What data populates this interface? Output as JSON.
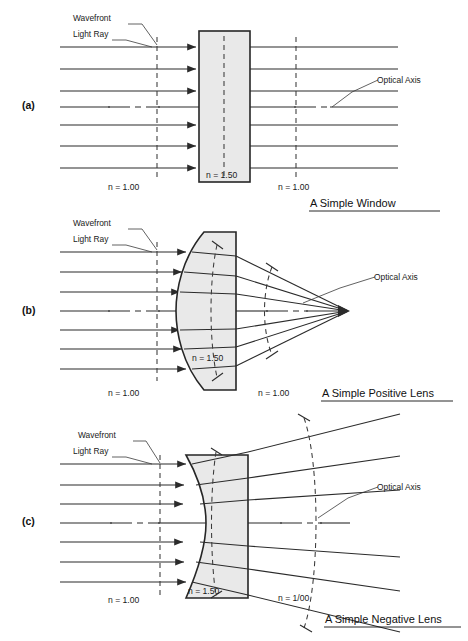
{
  "figure": {
    "background": "#ffffff",
    "ink": "#1a1a1a",
    "glass_fill": "#e9e9e9"
  },
  "common_labels": {
    "wavefront": "Wavefront",
    "light_ray": "Light Ray",
    "optical_axis": "Optical Axis",
    "n_air": "n = 1.00",
    "n_glass": "n = 1.50"
  },
  "panels": [
    {
      "id": "a",
      "letter": "(a)",
      "caption": "A Simple Window",
      "element": "plane-parallel window",
      "labels": {
        "wavefront": "Wavefront",
        "light_ray": "Light Ray",
        "optical_axis": "Optical Axis",
        "n_left": "n = 1.00",
        "n_glass": "n = 1.50",
        "n_right": "n = 1.00"
      },
      "ray_count": 7,
      "wavefronts": "straight vertical dashed lines before and after the window (undeviated)",
      "rays_exit": "parallel, undeviated"
    },
    {
      "id": "b",
      "letter": "(b)",
      "caption": "A Simple Positive Lens",
      "element": "plano-convex positive lens, convex side facing incoming light",
      "labels": {
        "wavefront": "Wavefront",
        "light_ray": "Light Ray",
        "optical_axis": "Optical Axis",
        "n_left": "n = 1.00",
        "n_glass": "n = 1.50",
        "n_right": "n = 1.00"
      },
      "ray_count": 7,
      "wavefronts": "flat entering, curved converging after the lens",
      "rays_exit": "converge to a single focal point on the optical axis"
    },
    {
      "id": "c",
      "letter": "(c)",
      "caption": "A Simple Negative Lens",
      "element": "plano-concave negative lens, concave side facing incoming light",
      "labels": {
        "wavefront": "Wavefront",
        "light_ray": "Light Ray",
        "optical_axis": "Optical Axis",
        "n_left": "n = 1.00",
        "n_glass": "n = 1.50",
        "n_right": "n = 1/00"
      },
      "ray_count": 7,
      "wavefronts": "flat entering, curved diverging after the lens",
      "rays_exit": "diverge away from the optical axis"
    }
  ]
}
